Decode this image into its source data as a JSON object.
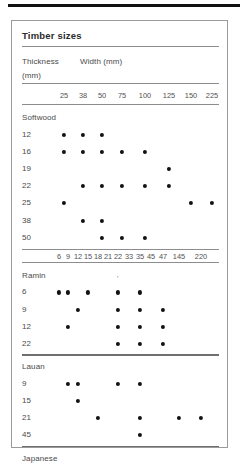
{
  "figure": {
    "title": "Timber sizes",
    "row_header_top": "Thickness",
    "row_header_bottom": "(mm)",
    "col_header": "Width (mm)"
  },
  "chart_data": {
    "type": "heatmap",
    "title": "Timber sizes",
    "xlabel": "Width (mm)",
    "ylabel": "Thickness (mm)",
    "grid": false,
    "legend": "none",
    "scales": [
      {
        "name": "upper",
        "applies_to": [
          "Softwood"
        ],
        "categories": [
          "25",
          "38",
          "50",
          "75",
          "100",
          "125",
          "150",
          "225"
        ]
      },
      {
        "name": "lower",
        "applies_to": [
          "Ramin",
          "Lauan",
          "Japanese Oak",
          "Iroko"
        ],
        "categories": [
          "6",
          "9",
          "12",
          "15",
          "18",
          "21",
          "22",
          "33",
          "35",
          "45",
          "47",
          "145",
          "220"
        ]
      }
    ],
    "groups": [
      {
        "name": "Softwood",
        "scale": "upper",
        "rows": [
          {
            "thickness": "12",
            "widths": [
              "25",
              "38",
              "50"
            ]
          },
          {
            "thickness": "16",
            "widths": [
              "25",
              "38",
              "50",
              "75",
              "100"
            ]
          },
          {
            "thickness": "19",
            "widths": [
              "125"
            ]
          },
          {
            "thickness": "22",
            "widths": [
              "38",
              "50",
              "75",
              "100",
              "125"
            ]
          },
          {
            "thickness": "25",
            "widths": [
              "25",
              "150",
              "225"
            ]
          },
          {
            "thickness": "38",
            "widths": [
              "38",
              "50"
            ]
          },
          {
            "thickness": "50",
            "widths": [
              "50",
              "75",
              "100"
            ]
          }
        ]
      },
      {
        "name": "Ramin",
        "scale": "lower",
        "rows": [
          {
            "thickness": "6",
            "widths": [
              "6",
              "9",
              "15",
              "22",
              "35"
            ]
          },
          {
            "thickness": "9",
            "widths": [
              "12",
              "22",
              "35",
              "47"
            ]
          },
          {
            "thickness": "12",
            "widths": [
              "9",
              "22",
              "35",
              "47"
            ]
          },
          {
            "thickness": "22",
            "widths": [
              "22",
              "35",
              "47"
            ]
          }
        ]
      },
      {
        "name": "Lauan",
        "scale": "lower",
        "rows": [
          {
            "thickness": "9",
            "widths": [
              "9",
              "12",
              "22",
              "35"
            ]
          },
          {
            "thickness": "15",
            "widths": [
              "12"
            ]
          },
          {
            "thickness": "21",
            "widths": [
              "18",
              "35",
              "145",
              "220"
            ]
          },
          {
            "thickness": "45",
            "widths": [
              "35"
            ]
          }
        ]
      },
      {
        "name": "Japanese Oak",
        "name_line1": "Japanese",
        "name_line2": "Oak",
        "scale": "lower",
        "rows": [
          {
            "thickness": "9",
            "widths": [
              "12"
            ]
          },
          {
            "thickness": "15",
            "widths": [
              "145",
              "220"
            ]
          }
        ]
      },
      {
        "name": "Iroko",
        "scale": "lower",
        "rows": [
          {
            "thickness": "21",
            "widths": [
              "22",
              "47",
              "145",
              "220"
            ]
          }
        ]
      }
    ]
  }
}
